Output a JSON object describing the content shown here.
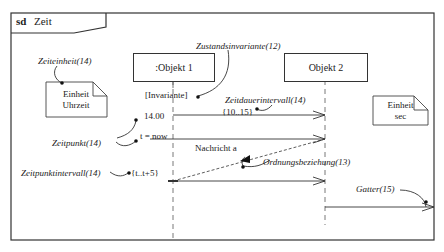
{
  "frame": {
    "kind": "sd",
    "name": "Zeit"
  },
  "lifelines": [
    {
      "label": ":Objekt 1"
    },
    {
      "label": "Objekt 2"
    }
  ],
  "notes": [
    {
      "lines": [
        "Einheit",
        "Uhrzeit"
      ]
    },
    {
      "lines": [
        "Einheit",
        "sec"
      ]
    }
  ],
  "annotations": {
    "zeiteinheit": "Zeiteinheit(14)",
    "zustandsinvariante": "Zustandsinvariante(12)",
    "zeitdauerintervall": "Zeitdauerintervall(14)",
    "zeitpunkt": "Zeitpunkt(14)",
    "zeitpunktintervall": "Zeitpunktintervall(14)",
    "ordnungsbeziehung": "Ordnungsbeziehung(13)",
    "gatter": "Gatter(15)"
  },
  "constraints": {
    "invariante": "[Invariante]",
    "duration": "{10..15}",
    "time_value": "14.00",
    "time_now": "t = now",
    "time_interval": "{t..t+5}"
  },
  "messages": [
    {
      "label": ""
    },
    {
      "label": "Nachricht a"
    },
    {
      "label": ""
    },
    {
      "label": ""
    }
  ]
}
